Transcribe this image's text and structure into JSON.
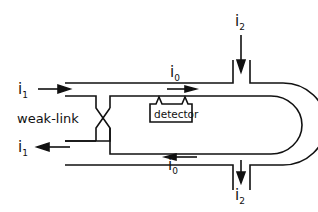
{
  "diagram": {
    "labels": {
      "i1_in": "i",
      "i1_in_sub": "1",
      "i1_out": "i",
      "i1_out_sub": "1",
      "i0_top": "i",
      "i0_top_sub": "0",
      "i0_bottom": "i",
      "i0_bottom_sub": "0",
      "i2_top": "i",
      "i2_top_sub": "2",
      "i2_bottom": "i",
      "i2_bottom_sub": "2",
      "weak_link": "weak-link",
      "detector": "detector"
    },
    "colors": {
      "line": "#111111",
      "background": "#ffffff"
    }
  }
}
